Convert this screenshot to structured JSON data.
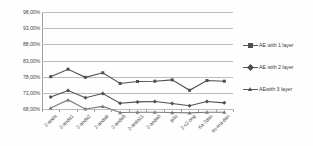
{
  "chart_data": {
    "type": "line",
    "title": "",
    "subtitle": "",
    "xlabel": "",
    "ylabel": "",
    "ylim": [
      68,
      98
    ],
    "yticks": [
      98,
      93,
      88,
      83,
      78,
      73,
      68
    ],
    "ytick_labels": [
      "98,00%",
      "93,00%",
      "88,00%",
      "83,00%",
      "78,00%",
      "73,00%",
      "68,00%"
    ],
    "grid": true,
    "legend_position": "right",
    "categories": [
      "2-anda",
      "2-anda1",
      "2-anda2",
      "2-anda8",
      "2-anda9",
      "2-anda11",
      "2-anda0",
      "jollo",
      "2-s2-ong",
      "6a-7dan",
      "6s-ma-dan"
    ],
    "series": [
      {
        "name": "AE with 1 layer",
        "marker": "square",
        "color": "#4f4f4f",
        "values": [
          78.0,
          80.3,
          77.8,
          79.2,
          75.9,
          76.5,
          76.6,
          77.0,
          73.8,
          76.8,
          76.6
        ]
      },
      {
        "name": "AE with 2 layer",
        "marker": "diamond",
        "color": "#4f4f4f",
        "values": [
          71.7,
          73.7,
          71.5,
          72.8,
          69.8,
          70.2,
          70.3,
          69.7,
          69.0,
          70.3,
          69.9
        ]
      },
      {
        "name": "AE with 3 layer",
        "marker": "triangle",
        "color": "#7a7a7a",
        "values": [
          68.3,
          70.8,
          68.0,
          68.8,
          66.9,
          67.0,
          67.0,
          66.9,
          66.8,
          67.0,
          67.0
        ]
      }
    ],
    "legend_entries": [
      "AE with 1 layer",
      "AE with 2 layer",
      "AEwith 3 layer"
    ]
  },
  "legend": {
    "items": [
      {
        "label": "AE with 1 layer",
        "marker": "square"
      },
      {
        "label": "AE with 2 layer",
        "marker": "diamond"
      },
      {
        "label": "AEwith 3 layer",
        "marker": "triangle"
      }
    ]
  },
  "axes": {
    "y_tick_labels": [
      "98,00%",
      "93,00%",
      "88,00%",
      "83,00%",
      "78,00%",
      "73,00%",
      "68,00%"
    ],
    "x_tick_labels": [
      "2-anda",
      "2-anda1",
      "2-anda2",
      "2-anda8",
      "2-anda9",
      "2-anda11",
      "2-anda0",
      "jollo",
      "2-s2-ong",
      "6a-7dan",
      "6s-ma-dan"
    ]
  },
  "colors": {
    "grid": "#b9bdc4",
    "axis": "#9aa0a8",
    "series_dark": "#4f4f4f",
    "series_light": "#7a7a7a",
    "text": "#3f3f3f",
    "background": "#fefefe"
  }
}
